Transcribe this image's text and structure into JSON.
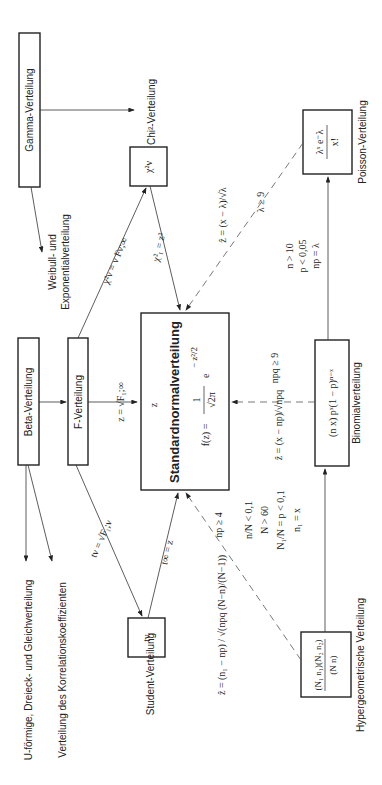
{
  "orientation": "rotated -90deg (text reads bottom to top)",
  "nodes": {
    "gamma": {
      "label": "Gamma-Verteilung"
    },
    "beta": {
      "label": "Beta-Verteilung"
    },
    "f": {
      "label": "F-Verteilung"
    },
    "standardnormal": {
      "title": "Standardnormalverteilung",
      "var": "z",
      "formula_lhs": "f(z) =",
      "formula_num": "1",
      "formula_den": "√2π",
      "formula_exp": "e",
      "exp_sup": "− z²/2"
    },
    "chi2": {
      "symbol": "χ²ν",
      "label": "Chi²-Verteilung"
    },
    "binomial": {
      "formula": "(n x) pˣ(1 − p)ⁿ⁻ˣ",
      "label": "Binomialverteilung"
    },
    "poisson": {
      "formula_num": "λˣ e⁻λ",
      "formula_den": "x!",
      "label": "Poisson-Verteilung"
    },
    "student": {
      "symbol": "tν",
      "label": "Student-Verteilung"
    },
    "hypergeometric": {
      "formula_num": "(N₁ n₁)(N₂ n₂)",
      "formula_den": "(N n)",
      "label": "Hypergeometrische Verteilung"
    }
  },
  "outputs": {
    "weibull": "Weibull- und",
    "weibull2": "Exponentialverteilung",
    "uform": "U-förmige, Dreieck- und Gleichverteilung",
    "korrelation": "Verteilung des Korrelationskoeffizienten"
  },
  "edges": {
    "chi2_from_f": "χ²ν = ν Fν;∞",
    "chi1_eq_z2": "χ²₁ = z²",
    "z_from_f": "z = √F₁;∞",
    "z_label": "z",
    "t_from_f": "tν = √F₁;ν",
    "t_inf": "t∞ = z",
    "poisson_to_z": "ẑ = (x − λ)/√λ",
    "lambda_cond": "λ ≥ 9",
    "binom_to_poisson_cond": [
      "n > 10",
      "p < 0,05",
      "np = λ"
    ],
    "binom_to_z": "ẑ = (x − np)/√npq",
    "npq_cond": "npq ≥ 9",
    "hyper_to_z": "ẑ = (n₁ − np) / √(npq (N−n)/(N−1))",
    "np_cond": "np ≥ 4",
    "hyper_to_binom_cond": [
      "n/N < 0,1",
      "N > 60",
      "N₁/N = p < 0,1",
      "n₁ = x"
    ]
  }
}
